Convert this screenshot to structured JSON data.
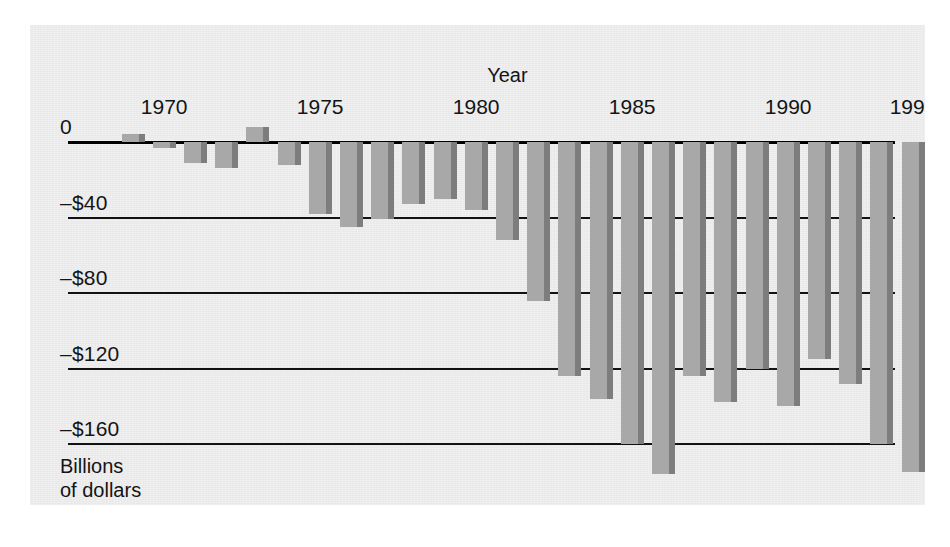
{
  "figure": {
    "panel_bg": "#ececed",
    "page_bg": "#ffffff",
    "bar_color": "#a8a8a8",
    "bar_shadow_color": "#7d7d7d",
    "axis_color": "#111214"
  },
  "axis": {
    "x_title": "Year",
    "y_caption": "Billions\nof dollars",
    "y_ticks": [
      "0",
      "–$40",
      "–$80",
      "–$120",
      "–$160"
    ],
    "y_tick_values": [
      0,
      -40,
      -80,
      -120,
      -160
    ],
    "x_ticks": [
      "1970",
      "1975",
      "1980",
      "1985",
      "1990",
      "1994"
    ],
    "x_tick_values": [
      1970,
      1975,
      1980,
      1985,
      1990,
      1994
    ]
  },
  "chart_data": {
    "type": "bar",
    "title": "",
    "subtitle": "",
    "xlabel": "Year",
    "ylabel": "Billions of dollars",
    "ylim": [
      -180,
      12
    ],
    "xlim": [
      1968.5,
      1994.5
    ],
    "grid": true,
    "legend": null,
    "orientation": "vertical",
    "units": "Billions of dollars",
    "note": "U.S. federal budget surplus/deficit by fiscal year. Positive bars rise above the zero line (surplus); negative bars hang below (deficit).",
    "categories": [
      "1969",
      "1970",
      "1971",
      "1972",
      "1973",
      "1974",
      "1975",
      "1976",
      "1977",
      "1978",
      "1979",
      "1980",
      "1981",
      "1982",
      "1983",
      "1984",
      "1985",
      "1986",
      "1987",
      "1988",
      "1989",
      "1990",
      "1991",
      "1992",
      "1993",
      "1994"
    ],
    "values": [
      3,
      -3,
      -23,
      -23,
      -15,
      5,
      -45,
      -66,
      -45,
      -49,
      -40,
      -74,
      -79,
      -128,
      -208,
      -185,
      -212,
      -221,
      -150,
      -155,
      -152,
      -221,
      -269,
      -290,
      -255,
      -203
    ],
    "values_plotted": [
      4,
      -3,
      -11,
      -14,
      8,
      -12,
      -38,
      -45,
      -41,
      -33,
      -30,
      -36,
      -52,
      -84,
      -124,
      -136,
      -160,
      -176,
      -124,
      -138,
      -120,
      -140,
      -115,
      -128,
      -160,
      -175
    ],
    "bar_count": 26
  }
}
